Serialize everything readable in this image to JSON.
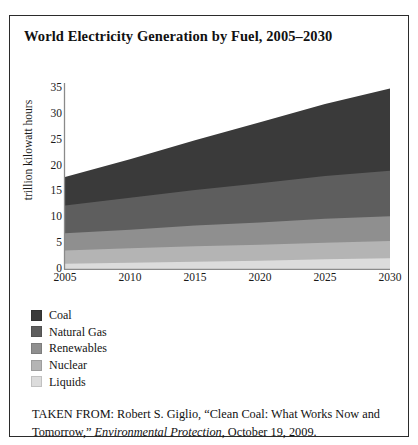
{
  "figure": {
    "title": "World Electricity Generation by Fuel, 2005–2030",
    "caption_prefix": "TAKEN FROM: Robert S. Giglio, “Clean Coal: What Works Now and Tomorrow,” ",
    "caption_italic": "Environmental Protection",
    "caption_suffix": ", October 19, 2009."
  },
  "chart_data": {
    "type": "area",
    "title": "World Electricity Generation by Fuel, 2005–2030",
    "xlabel": "",
    "ylabel": "trillion kilowatt hours",
    "xlim": [
      2005,
      2030
    ],
    "ylim": [
      0,
      35
    ],
    "ytick_labels": [
      "0",
      "5",
      "10",
      "15",
      "20",
      "25",
      "30",
      "35"
    ],
    "yticks": [
      0,
      5,
      10,
      15,
      20,
      25,
      30,
      35
    ],
    "xtick_labels": [
      "2005",
      "2010",
      "2015",
      "2020",
      "2025",
      "2030"
    ],
    "xticks": [
      2005,
      2010,
      2015,
      2020,
      2025,
      2030
    ],
    "grid": false,
    "stacked": true,
    "legend_position": "below-left",
    "x": [
      2005,
      2010,
      2015,
      2020,
      2025,
      2030
    ],
    "series": [
      {
        "name": "Liquids",
        "color": "#dcdcdc",
        "values": [
          1.0,
          1.2,
          1.4,
          1.6,
          1.9,
          2.1
        ],
        "stack_order": 1
      },
      {
        "name": "Nuclear",
        "color": "#b4b4b4",
        "values": [
          2.6,
          2.8,
          3.0,
          3.1,
          3.2,
          3.3
        ],
        "stack_order": 2
      },
      {
        "name": "Renewables",
        "color": "#8f8f8f",
        "values": [
          3.3,
          3.6,
          4.0,
          4.3,
          4.6,
          4.8
        ],
        "stack_order": 3
      },
      {
        "name": "Natural Gas",
        "color": "#5e5e5e",
        "values": [
          5.4,
          6.2,
          6.9,
          7.6,
          8.3,
          8.8
        ],
        "stack_order": 4
      },
      {
        "name": "Coal",
        "color": "#3a3a3a",
        "values": [
          5.5,
          7.4,
          9.6,
          11.8,
          13.9,
          15.9
        ],
        "stack_order": 5
      }
    ],
    "cumulative_tops": {
      "Liquids": [
        1.0,
        1.2,
        1.4,
        1.6,
        1.9,
        2.1
      ],
      "Nuclear": [
        3.6,
        4.0,
        4.4,
        4.7,
        5.1,
        5.4
      ],
      "Renewables": [
        6.9,
        7.6,
        8.4,
        9.0,
        9.7,
        10.2
      ],
      "Natural Gas": [
        12.3,
        13.8,
        15.3,
        16.6,
        18.0,
        19.0
      ],
      "Coal": [
        17.8,
        21.2,
        24.9,
        28.4,
        31.9,
        34.9
      ]
    }
  },
  "legend": {
    "items": [
      {
        "label": "Coal",
        "color": "#3a3a3a"
      },
      {
        "label": "Natural Gas",
        "color": "#5e5e5e"
      },
      {
        "label": "Renewables",
        "color": "#8f8f8f"
      },
      {
        "label": "Nuclear",
        "color": "#b4b4b4"
      },
      {
        "label": "Liquids",
        "color": "#dcdcdc"
      }
    ]
  }
}
